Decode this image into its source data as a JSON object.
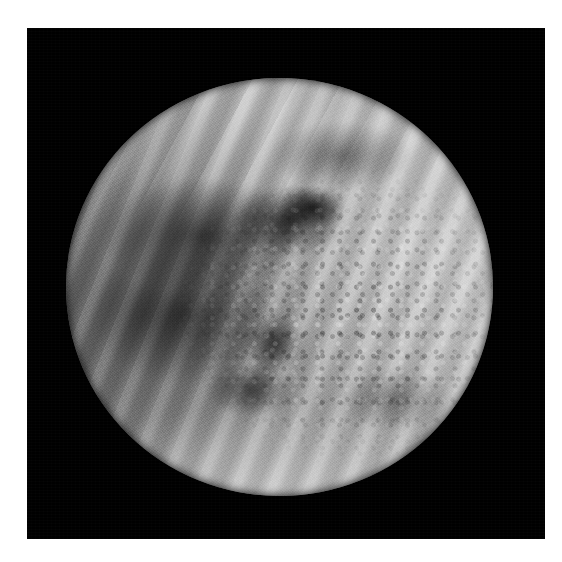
{
  "document": {
    "kind": "scanned-photographic-plate",
    "page_background": "#ffffff",
    "caption": ""
  },
  "image_panel": {
    "name": "venus-ultraviolet-image",
    "background_color": "#000000",
    "border_color": "#c8c8c8",
    "left": 27,
    "top": 28,
    "width": 518,
    "height": 511
  },
  "subject": {
    "object_name": "Venus",
    "rendering": "grayscale ultraviolet cloud-top view",
    "disk": {
      "center_x": 279,
      "center_y": 287,
      "diameter": 427,
      "phase": "near-full illuminated disk"
    },
    "features": [
      {
        "name": "north-polar-bright-hood",
        "description": "bright banded polar cap across the top of the disk",
        "tone": "#e2e2e2"
      },
      {
        "name": "mid-latitude-streak-bands",
        "description": "diagonal bright and dark streaks running upper-left to lower-right",
        "tone": "#b0b0b0"
      },
      {
        "name": "dark-equatorial-cloud-mass",
        "description": "large dusky region left and below centre",
        "tone": "#4a4a4a"
      },
      {
        "name": "darkest-core-patch",
        "description": "near-black patch above and right of disk centre",
        "tone": "#121212"
      },
      {
        "name": "subsolar-convective-cells",
        "description": "granular mottled cell texture right of centre",
        "tone": "#c4c4c4"
      },
      {
        "name": "southern-limb-bright-band",
        "description": "bright arc along the lower limb",
        "tone": "#dcdcdc"
      },
      {
        "name": "bright-right-limb",
        "description": "brightened eastern limb",
        "tone": "#d8d8d8"
      }
    ]
  },
  "palette": {
    "page_white": "#ffffff",
    "panel_black": "#000000",
    "disk_midtone": "#9a9a9a",
    "disk_highlight": "#e6e6e6",
    "disk_shadow": "#3c3c3c"
  }
}
